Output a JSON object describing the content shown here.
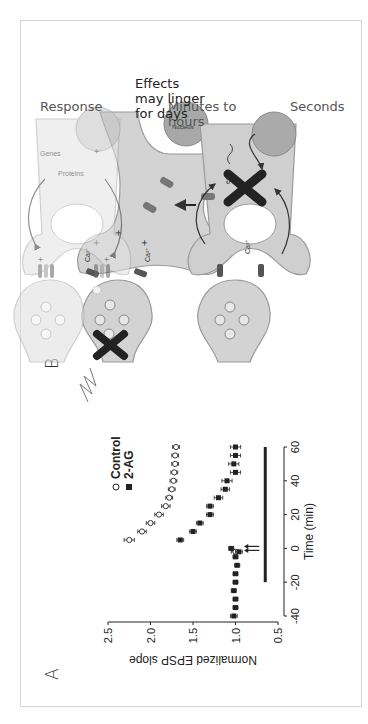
{
  "panels": {
    "a": {
      "letter": "A"
    },
    "b": {
      "letter": "B"
    }
  },
  "chart_data": {
    "type": "scatter",
    "title": "",
    "xlabel": "Time (min)",
    "ylabel": "Normalized EPSP slope",
    "xlim": [
      -40,
      60
    ],
    "ylim": [
      0.5,
      2.5
    ],
    "xticks": [
      "-40",
      "-20",
      "0",
      "20",
      "40",
      "60"
    ],
    "yticks": [
      "0.5",
      "1.0",
      "1.5",
      "2.0",
      "2.5"
    ],
    "grid": false,
    "legend_position": "upper right",
    "legend": [
      {
        "name": "Control",
        "marker": "open-circle"
      },
      {
        "name": "2-AG",
        "marker": "filled-square"
      }
    ],
    "annotations": {
      "arrows_at_time": 0,
      "arrow_count": 2,
      "bar": {
        "from": -20,
        "to": 60,
        "y": 0.65
      }
    },
    "series": [
      {
        "name": "Control",
        "x": [
          -2,
          5,
          10,
          15,
          20,
          25,
          30,
          35,
          40,
          45,
          50,
          55,
          60
        ],
        "y": [
          1.0,
          2.25,
          2.1,
          2.0,
          1.9,
          1.82,
          1.78,
          1.75,
          1.73,
          1.72,
          1.71,
          1.71,
          1.7
        ],
        "err": [
          0.05,
          0.06,
          0.05,
          0.05,
          0.05,
          0.05,
          0.04,
          0.04,
          0.04,
          0.04,
          0.04,
          0.04,
          0.04
        ]
      },
      {
        "name": "2-AG",
        "x": [
          -40,
          -35,
          -30,
          -25,
          -20,
          -15,
          -10,
          -5,
          -2,
          0,
          5,
          10,
          15,
          20,
          25,
          30,
          35,
          40,
          45,
          50,
          55,
          60
        ],
        "y": [
          1.02,
          1.0,
          1.0,
          1.02,
          1.0,
          1.0,
          0.98,
          1.0,
          0.96,
          1.05,
          1.65,
          1.5,
          1.42,
          1.3,
          1.3,
          1.2,
          1.12,
          1.1,
          1.0,
          1.02,
          1.0,
          1.0
        ],
        "err": [
          0.04,
          0.03,
          0.03,
          0.03,
          0.03,
          0.03,
          0.03,
          0.03,
          0.04,
          0.03,
          0.04,
          0.04,
          0.04,
          0.04,
          0.04,
          0.05,
          0.05,
          0.06,
          0.06,
          0.06,
          0.06,
          0.06
        ]
      }
    ]
  },
  "diagram": {
    "stages": [
      {
        "label": "Seconds",
        "nucleus_label": "Nucleus"
      },
      {
        "label": "Minutes to hours",
        "partial_label": "es"
      },
      {
        "label": "Response",
        "proteins_label": "Proteins",
        "genes_label": "Genes"
      }
    ],
    "ion_label": "Ca2+",
    "caption": "Effects may linger for days"
  }
}
